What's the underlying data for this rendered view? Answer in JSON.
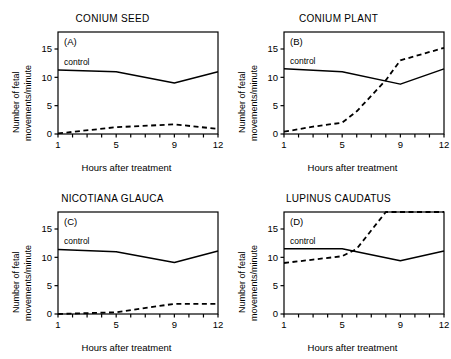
{
  "figure": {
    "background": "#ffffff",
    "ink": "#000000",
    "panel_count": 4
  },
  "axes": {
    "x_title": "Hours after treatment",
    "y_title_line1": "Number of fetal",
    "y_title_line2": "movements/minute",
    "x_tick_labels": [
      "1",
      "5",
      "9",
      "12"
    ],
    "y_tick_labels": [
      "0",
      "5",
      "10",
      "15"
    ]
  },
  "chart_data": [
    {
      "type": "line",
      "panel": "A",
      "panel_letter": "(A)",
      "title": "CONIUM SEED",
      "xlabel": "Hours after treatment",
      "ylabel": "Number of fetal movements/minute",
      "xlim": [
        1,
        12
      ],
      "ylim": [
        0,
        18
      ],
      "x_ticks": [
        1,
        2,
        3,
        4,
        5,
        6,
        7,
        8,
        9,
        10,
        11,
        12
      ],
      "x_tick_labels_at": [
        1,
        5,
        9,
        12
      ],
      "y_ticks": [
        0,
        5,
        10,
        15
      ],
      "grid": false,
      "legend": "inline-label",
      "series": [
        {
          "name": "control",
          "style": "solid",
          "label": "control",
          "x": [
            1,
            5,
            9,
            12
          ],
          "values": [
            11.3,
            11.0,
            9.0,
            11.0
          ]
        },
        {
          "name": "treated",
          "style": "dashed",
          "label": "",
          "x": [
            1,
            5,
            9,
            12
          ],
          "values": [
            0.1,
            1.2,
            1.7,
            0.9
          ]
        }
      ]
    },
    {
      "type": "line",
      "panel": "B",
      "panel_letter": "(B)",
      "title": "CONIUM PLANT",
      "xlabel": "Hours after treatment",
      "ylabel": "Number of fetal movements/minute",
      "xlim": [
        1,
        12
      ],
      "ylim": [
        0,
        18
      ],
      "x_ticks": [
        1,
        2,
        3,
        4,
        5,
        6,
        7,
        8,
        9,
        10,
        11,
        12
      ],
      "x_tick_labels_at": [
        1,
        5,
        9,
        12
      ],
      "y_ticks": [
        0,
        5,
        10,
        15
      ],
      "grid": false,
      "legend": "inline-label",
      "series": [
        {
          "name": "control",
          "style": "solid",
          "label": "control",
          "x": [
            1,
            5,
            9,
            12
          ],
          "values": [
            11.5,
            11.0,
            8.8,
            11.5
          ]
        },
        {
          "name": "treated",
          "style": "dashed",
          "label": "",
          "x": [
            1,
            3,
            5,
            6,
            8,
            9,
            12
          ],
          "values": [
            0.4,
            1.3,
            2.0,
            4.0,
            9.5,
            13.0,
            15.2
          ]
        }
      ]
    },
    {
      "type": "line",
      "panel": "C",
      "panel_letter": "(C)",
      "title": "NICOTIANA GLAUCA",
      "xlabel": "Hours after treatment",
      "ylabel": "Number of fetal movements/minute",
      "xlim": [
        1,
        12
      ],
      "ylim": [
        0,
        18
      ],
      "x_ticks": [
        1,
        2,
        3,
        4,
        5,
        6,
        7,
        8,
        9,
        10,
        11,
        12
      ],
      "x_tick_labels_at": [
        1,
        5,
        9,
        12
      ],
      "y_ticks": [
        0,
        5,
        10,
        15
      ],
      "grid": false,
      "legend": "inline-label",
      "series": [
        {
          "name": "control",
          "style": "solid",
          "label": "control",
          "x": [
            1,
            5,
            9,
            12
          ],
          "values": [
            11.4,
            11.0,
            9.1,
            11.1
          ]
        },
        {
          "name": "treated",
          "style": "dashed",
          "label": "",
          "x": [
            1,
            5,
            9,
            12
          ],
          "values": [
            0.0,
            0.3,
            1.8,
            1.8
          ]
        }
      ]
    },
    {
      "type": "line",
      "panel": "D",
      "panel_letter": "(D)",
      "title": "LUPINUS CAUDATUS",
      "xlabel": "Hours after treatment",
      "ylabel": "Number of fetal movements/minute",
      "xlim": [
        1,
        12
      ],
      "ylim": [
        0,
        18
      ],
      "x_ticks": [
        1,
        2,
        3,
        4,
        5,
        6,
        7,
        8,
        9,
        10,
        11,
        12
      ],
      "x_tick_labels_at": [
        1,
        5,
        9,
        12
      ],
      "y_ticks": [
        0,
        5,
        10,
        15
      ],
      "grid": false,
      "legend": "inline-label",
      "series": [
        {
          "name": "control",
          "style": "solid",
          "label": "control",
          "x": [
            1,
            5,
            9,
            12
          ],
          "values": [
            11.5,
            11.5,
            9.4,
            11.1
          ]
        },
        {
          "name": "treated",
          "style": "dashed",
          "label": "",
          "x": [
            1,
            3,
            5,
            6,
            8,
            9,
            12
          ],
          "values": [
            9.0,
            9.6,
            10.2,
            11.5,
            18.0,
            18.0,
            18.0
          ]
        }
      ]
    }
  ]
}
